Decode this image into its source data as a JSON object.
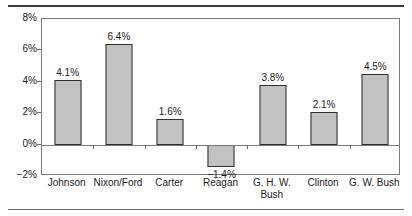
{
  "chart_data": {
    "type": "bar",
    "title": "",
    "subtitle": "",
    "xlabel": "",
    "ylabel": "",
    "categories": [
      "Johnson",
      "Nixon/Ford",
      "Carter",
      "Reagan",
      "G. H. W. Bush",
      "Clinton",
      "G. W. Bush"
    ],
    "values": [
      4.1,
      6.4,
      1.6,
      -1.4,
      3.8,
      2.1,
      4.5
    ],
    "data_labels": [
      "4.1%",
      "6.4%",
      "1.6%",
      "−1.4%",
      "3.8%",
      "2.1%",
      "4.5%"
    ],
    "ylim": [
      -2,
      8
    ],
    "ytick_values": [
      -2,
      0,
      2,
      4,
      6,
      8
    ],
    "ytick_labels": [
      "−2%",
      "0%",
      "2%",
      "4%",
      "6%",
      "8%"
    ],
    "grid": false,
    "legend": null,
    "bar_color": "#c2c2c2",
    "bar_border_color": "#2e2e2e",
    "axis_color": "#7a7a7a",
    "text_color": "#1a1a1a"
  }
}
